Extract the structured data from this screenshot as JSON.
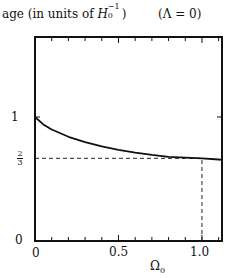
{
  "chart_data": {
    "type": "line",
    "subtitle": "(Λ = 0)",
    "xlabel": "Ω0",
    "ylabel": "age (in units of H0^-1)",
    "xlim": [
      0,
      1.12
    ],
    "ylim": [
      0,
      1.645
    ],
    "grid": false,
    "legend": null,
    "x_ticks": [
      0,
      0.5,
      1.0
    ],
    "x_tick_labels": [
      "0",
      "0.5",
      "1.0"
    ],
    "x_minor_tick_step": 0.1,
    "y_ticks": [
      0,
      0.6667,
      1
    ],
    "y_tick_labels": [
      "0",
      "2/3",
      "1"
    ],
    "series": [
      {
        "name": "age",
        "x": [
          0,
          0.05,
          0.1,
          0.2,
          0.3,
          0.4,
          0.5,
          0.6,
          0.7,
          0.8,
          0.9,
          1.0,
          1.1,
          1.12
        ],
        "values": [
          1.0,
          0.94,
          0.899,
          0.84,
          0.797,
          0.763,
          0.735,
          0.713,
          0.694,
          0.679,
          0.672,
          0.667,
          0.657,
          0.655
        ]
      }
    ],
    "annotations": [
      {
        "type": "hline-dashed",
        "y": 0.6667,
        "x_from": 0,
        "x_to": 1.0
      },
      {
        "type": "vline-dashed",
        "x": 1.0,
        "y_from": 0,
        "y_to": 0.6667
      }
    ]
  },
  "labels": {
    "ylabel_prefix": "age (in units of ",
    "ylabel_H": "H",
    "ylabel_sub": "0",
    "ylabel_sup": "−1",
    "ylabel_suffix": ")",
    "condition": "(Λ = 0)",
    "xlabel_main": "Ω",
    "xlabel_sub": "0",
    "ytick_0": "0",
    "ytick_1": "1",
    "ytick_frac_num": "2",
    "ytick_frac_den": "3",
    "xtick_0": "0",
    "xtick_05": "0.5",
    "xtick_10": "1.0"
  }
}
